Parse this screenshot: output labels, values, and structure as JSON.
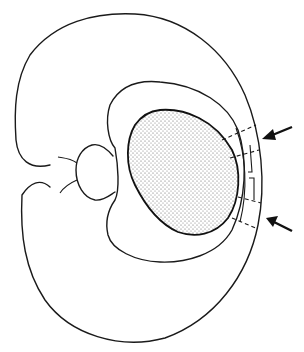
{
  "figure": {
    "type": "line-art schematic cross-section",
    "background": "#ffffff",
    "ink_color": "#1a1a1a",
    "stipple_color": "#9a9a9a",
    "labels": [],
    "elements": {
      "outer_body": "outer kidney-shaped contour with notch on left",
      "inner_contour": "inner concentric contour around core",
      "stippled_core": "dotted oval mass",
      "hilum_structure": "small bulb with branching lines near notch",
      "incision_region": "dashed lines and step-shaped cut at right margin",
      "arrows": [
        "upper-right arrow pointing left",
        "lower-right arrow pointing left"
      ]
    }
  }
}
